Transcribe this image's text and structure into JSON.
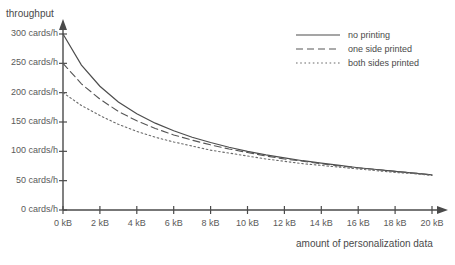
{
  "chart_data": {
    "type": "line",
    "title": "",
    "xlabel": "amount of personalization data",
    "ylabel": "throughput",
    "xlim": [
      0,
      20
    ],
    "ylim": [
      0,
      300
    ],
    "grid": false,
    "legend_position": "top-right",
    "x_unit": "kB",
    "y_unit": "cards/h",
    "x_ticks": [
      0,
      2,
      4,
      6,
      8,
      10,
      12,
      14,
      16,
      18,
      20
    ],
    "x_tick_labels": [
      "0 kB",
      "2 kB",
      "4 kB",
      "6 kB",
      "8 kB",
      "10 kB",
      "12 kB",
      "14 kB",
      "16 kB",
      "18 kB",
      "20 kB"
    ],
    "y_ticks": [
      0,
      50,
      100,
      150,
      200,
      250,
      300
    ],
    "y_tick_labels": [
      "0 cards/h",
      "50 cards/h",
      "100 cards/h",
      "150 cards/h",
      "200 cards/h",
      "250 cards/h",
      "300 cards/h"
    ],
    "x": [
      0,
      1,
      2,
      3,
      4,
      5,
      6,
      7,
      8,
      9,
      10,
      11,
      12,
      13,
      14,
      15,
      16,
      17,
      18,
      19,
      20
    ],
    "series": [
      {
        "name": "no printing",
        "style": "solid",
        "color": "#4d4d4d",
        "values": [
          300,
          247,
          211,
          184,
          164,
          148,
          135,
          124,
          115,
          107,
          100,
          94,
          89,
          84,
          80,
          76,
          72,
          69,
          66,
          63,
          60
        ]
      },
      {
        "name": "one side printed",
        "style": "dashed",
        "color": "#565656",
        "values": [
          250,
          215,
          189,
          168,
          152,
          139,
          128,
          119,
          111,
          104,
          98,
          92,
          87,
          83,
          79,
          75,
          72,
          69,
          66,
          63,
          60
        ]
      },
      {
        "name": "both sides printed",
        "style": "dotted",
        "color": "#6b6b6b",
        "values": [
          200,
          178,
          161,
          146,
          134,
          124,
          116,
          109,
          102,
          97,
          92,
          87,
          83,
          79,
          76,
          73,
          70,
          67,
          64,
          62,
          59
        ]
      }
    ]
  },
  "axes": {
    "y_title": "throughput",
    "x_title": "amount of personalization data"
  },
  "legend": {
    "items": [
      {
        "label": "no printing"
      },
      {
        "label": "one side printed"
      },
      {
        "label": "both sides printed"
      }
    ]
  },
  "colors": {
    "axis": "#4a4a4a",
    "text": "#555555",
    "series_solid": "#4d4d4d",
    "series_dashed": "#565656",
    "series_dotted": "#6b6b6b",
    "background": "#ffffff"
  }
}
